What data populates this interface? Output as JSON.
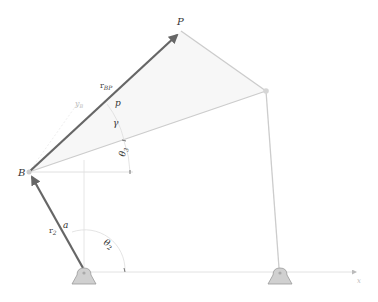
{
  "diagram": {
    "type": "four-bar-linkage-coupler",
    "colors": {
      "vector": "#666666",
      "link": "#c8c8c8",
      "guide": "#dddddd",
      "ground_fill": "#cfcfcf",
      "ground_stroke": "#9a9a9a",
      "coupler_fill": "#f6f6f6"
    },
    "points": {
      "O2": {
        "x": 84,
        "y": 271
      },
      "B": {
        "x": 29,
        "y": 172
      },
      "P": {
        "x": 181,
        "y": 31
      },
      "C": {
        "x": 266,
        "y": 91
      },
      "O4": {
        "x": 280,
        "y": 271
      }
    },
    "labels": {
      "point_P": "P",
      "point_B": "B",
      "vector_rBP_main": "r",
      "vector_rBP_sub": "BP",
      "vector_r2_main": "r",
      "vector_r2_sub": "2",
      "length_p": "p",
      "length_a": "a",
      "angle_gamma": "γ",
      "angle_theta3": "θ",
      "angle_theta3_sub": "3",
      "angle_theta2": "θ",
      "angle_theta2_sub": "2",
      "axis_y": "y",
      "axis_y_sub": "B",
      "axis_x": "x"
    }
  }
}
